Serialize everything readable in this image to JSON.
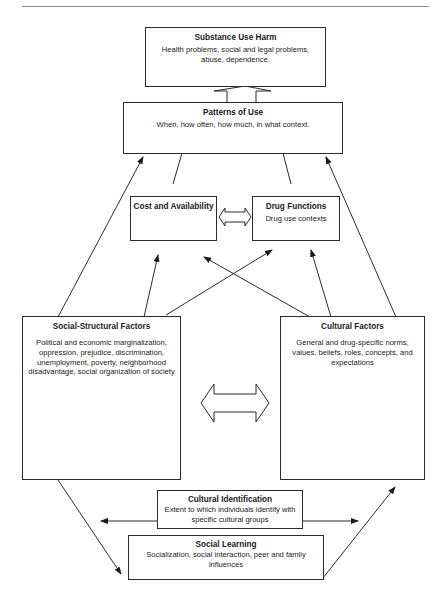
{
  "diagram": {
    "boxes": {
      "substance_use_harm": {
        "title": "Substance Use Harm",
        "desc": "Health problems, social and legal problems, abuse, dependence."
      },
      "patterns_of_use": {
        "title": "Patterns of Use",
        "desc": "When, how often, how much, in what context."
      },
      "cost_availability": {
        "title": "Cost and Availability",
        "desc": ""
      },
      "drug_functions": {
        "title": "Drug Functions",
        "desc": "Drug use contexts"
      },
      "social_structural": {
        "title": "Social-Structural Factors",
        "desc": "Political and economic marginalization, oppression, prejudice, discrimination, unemployment, poverty, neighborhood disadvantage, social organization of society"
      },
      "cultural_factors": {
        "title": "Cultural Factors",
        "desc": "General and drug-specific norms, values, beliefs, roles, concepts, and expectations"
      },
      "cultural_identification": {
        "title": "Cultural Identification",
        "desc": "Extent to which individuals identify with specific cultural groups"
      },
      "social_learning": {
        "title": "Social Learning",
        "desc": "Socialization, social interaction, peer and family influences"
      }
    },
    "connections": [
      {
        "from": "patterns_of_use",
        "to": "substance_use_harm",
        "type": "block-arrow"
      },
      {
        "from": "cost_availability",
        "to": "patterns_of_use",
        "type": "line"
      },
      {
        "from": "drug_functions",
        "to": "patterns_of_use",
        "type": "line"
      },
      {
        "from": "cost_availability",
        "to": "drug_functions",
        "type": "bidirectional-block-arrow"
      },
      {
        "from": "social_structural",
        "to": "patterns_of_use",
        "type": "arrow"
      },
      {
        "from": "cultural_factors",
        "to": "patterns_of_use",
        "type": "arrow"
      },
      {
        "from": "social_structural",
        "to": "cost_availability",
        "type": "arrow"
      },
      {
        "from": "social_structural",
        "to": "drug_functions",
        "type": "arrow"
      },
      {
        "from": "cultural_factors",
        "to": "cost_availability",
        "type": "arrow"
      },
      {
        "from": "cultural_factors",
        "to": "drug_functions",
        "type": "arrow"
      },
      {
        "from": "social_structural",
        "to": "cultural_factors",
        "type": "bidirectional-block-arrow"
      },
      {
        "from": "cultural_identification",
        "to": "left",
        "type": "arrow"
      },
      {
        "from": "cultural_identification",
        "to": "right",
        "type": "arrow"
      },
      {
        "from": "social_structural",
        "to": "social_learning",
        "type": "arrow"
      },
      {
        "from": "social_learning",
        "to": "cultural_factors",
        "type": "arrow"
      }
    ]
  }
}
